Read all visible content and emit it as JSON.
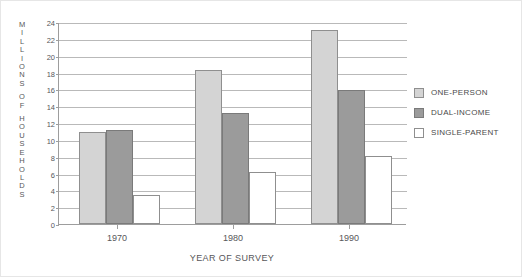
{
  "chart_data": {
    "type": "bar",
    "title": "",
    "xlabel": "YEAR OF SURVEY",
    "ylabel": "MILLIONS OF HOUSEHOLDS",
    "categories": [
      "1970",
      "1980",
      "1990"
    ],
    "series": [
      {
        "name": "ONE-PERSON",
        "color": "#d4d4d4",
        "values": [
          10.9,
          18.3,
          23.1
        ]
      },
      {
        "name": "DUAL-INCOME",
        "color": "#9b9b9b",
        "values": [
          11.2,
          13.2,
          15.9
        ]
      },
      {
        "name": "SINGLE-PARENT",
        "color": "#ffffff",
        "values": [
          3.4,
          6.2,
          8.1
        ]
      }
    ],
    "ylim": [
      0,
      24
    ],
    "yticks": [
      0,
      2,
      4,
      6,
      8,
      10,
      12,
      14,
      16,
      18,
      20,
      22,
      24
    ],
    "grid": true,
    "legend_position": "right"
  },
  "axis": {
    "ylabel_letters": [
      "M",
      "I",
      "L",
      "L",
      "I",
      "O",
      "N",
      "S",
      "",
      "O",
      "F",
      "",
      "H",
      "O",
      "U",
      "S",
      "E",
      "H",
      "O",
      "L",
      "D",
      "S"
    ]
  }
}
